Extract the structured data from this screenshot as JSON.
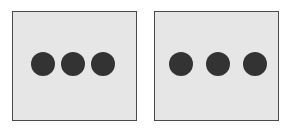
{
  "panels": [
    {
      "id": "left",
      "background": "#e6e6e6",
      "border": "#4a4a4a",
      "dots": [
        {
          "cx": 30,
          "color": "#333333"
        },
        {
          "cx": 60,
          "color": "#333333"
        },
        {
          "cx": 90,
          "color": "#333333"
        }
      ]
    },
    {
      "id": "right",
      "background": "#e6e6e6",
      "border": "#4a4a4a",
      "dots": [
        {
          "cx": 26,
          "color": "#333333"
        },
        {
          "cx": 63,
          "color": "#333333"
        },
        {
          "cx": 100,
          "color": "#333333"
        }
      ]
    }
  ]
}
